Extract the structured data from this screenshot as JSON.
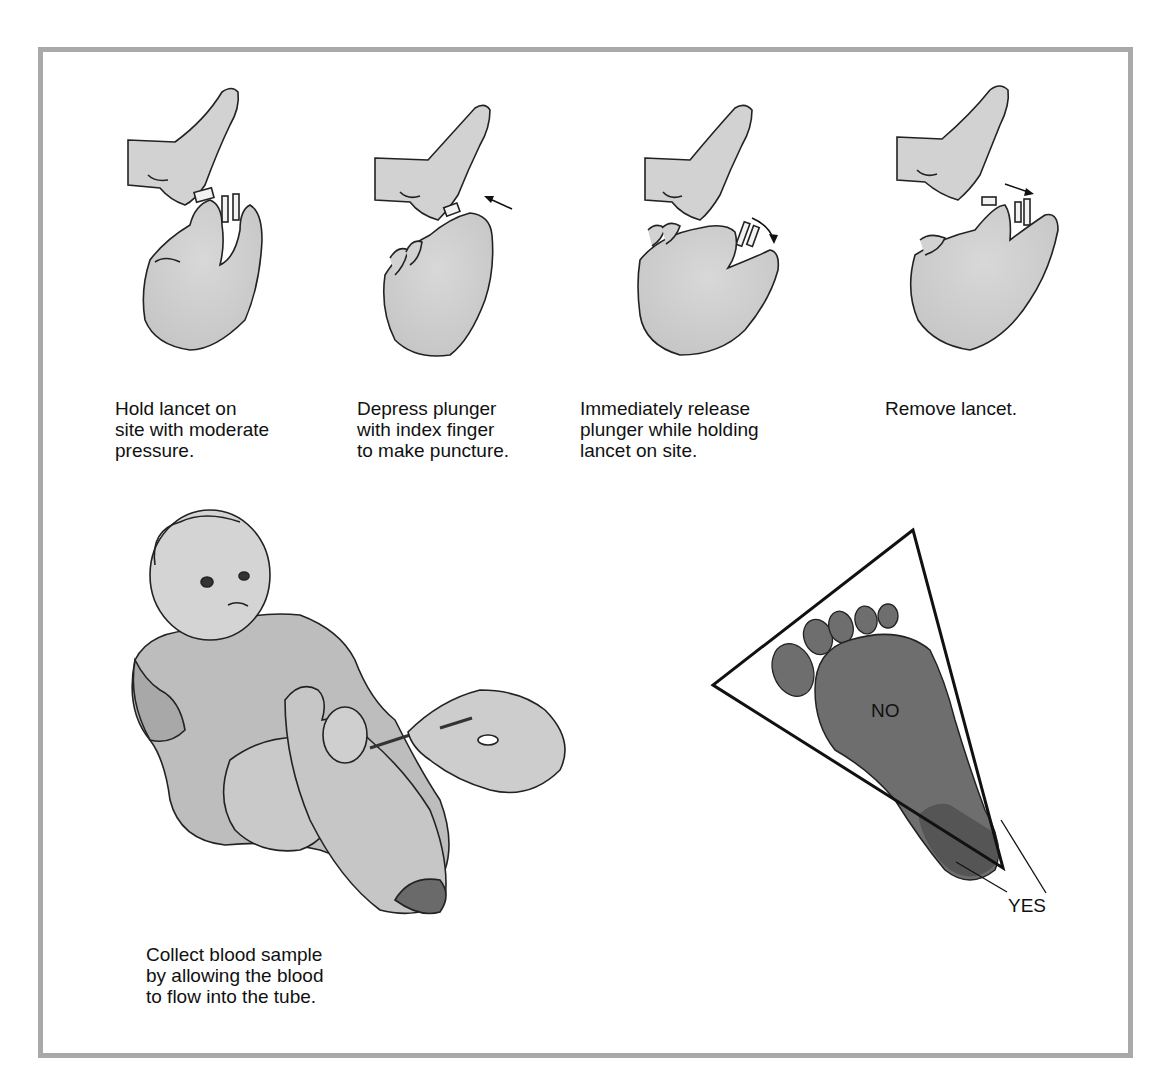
{
  "figure": {
    "steps": [
      {
        "caption": "Hold lancet on\nsite with moderate\npressure.",
        "illustration": "hand-holding-lancet-on-heel"
      },
      {
        "caption": "Depress plunger\nwith index finger\nto make puncture.",
        "illustration": "hand-depressing-plunger",
        "arrow": "toward-heel"
      },
      {
        "caption": "Immediately release\nplunger while holding\nlancet on site.",
        "illustration": "hand-releasing-plunger",
        "arrow": "curved-release"
      },
      {
        "caption": "Remove lancet.",
        "illustration": "hand-removing-lancet",
        "arrow": "away-from-heel"
      }
    ],
    "collection": {
      "caption": "Collect blood sample\nby allowing the blood\nto flow into the tube.",
      "illustration": "infant-heel-blood-collection"
    },
    "diagram": {
      "zone_no_label": "NO",
      "zone_yes_label": "YES",
      "foot_color": "#6e6e6e",
      "heel_side_color": "#555555"
    },
    "frame_color": "#a9a9a9"
  }
}
